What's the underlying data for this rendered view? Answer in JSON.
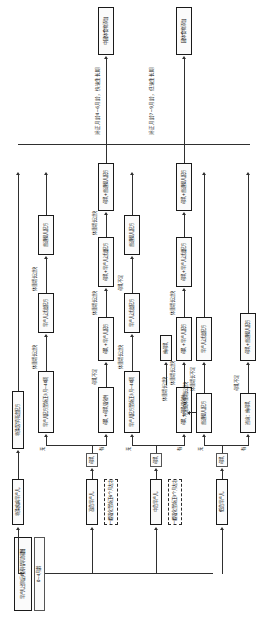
{
  "diagram": {
    "title": "早产儿出院后喂养指导流程图",
    "type": "flowchart",
    "orientation": "rotated-90-ccw",
    "entry": {
      "label": "早产儿出院后喂养指导流程图",
      "sublabel": "0~4月龄"
    },
    "risk_levels": [
      {
        "key": "high",
        "label": "特殊疾病早产儿"
      },
      {
        "key": "middle",
        "label": "中危早产儿"
      },
      {
        "key": "low",
        "label": "低危早产儿"
      }
    ],
    "notes": [
      {
        "id": "n1",
        "label": "一般强化至矫正6个月左右"
      },
      {
        "id": "n2",
        "label": "一般强化至矫正3个月左右"
      }
    ],
    "milk_gate": {
      "label": "母乳"
    },
    "answers": {
      "yes": "有",
      "no": "无"
    },
    "stages": [
      {
        "label": "矫正月龄4~6月龄，快速生长期"
      },
      {
        "label": "矫正月龄7~9月龄，低速生长期"
      }
    ],
    "outputs": [
      {
        "label": "中固体食物添加"
      },
      {
        "label": "固体食物添加"
      }
    ],
    "branches": [
      {
        "id": "special",
        "header": "特殊疾病早产儿",
        "nodes": [
          {
            "label": "特殊医学用途配方"
          }
        ],
        "edge_labels": []
      },
      {
        "id": "high-risk",
        "header": "高危早产儿",
        "nodes": [
          {
            "label": "母乳"
          },
          {
            "label": "早产儿配方至矫正3月~40周"
          },
          {
            "label": "早产儿过渡配方"
          },
          {
            "label": "普通婴儿配方"
          },
          {
            "label": "母乳+母乳强化剂"
          },
          {
            "label": "母乳+早产儿配方"
          },
          {
            "label": "母乳+早产儿过渡配方"
          },
          {
            "label": "母乳+普通婴儿配方"
          }
        ],
        "edge_labels": [
          "体重增长过快",
          "体重增长过快",
          "母乳不足",
          "体重增长过快",
          "体重增长过快",
          "体重增长过快"
        ]
      },
      {
        "id": "middle-risk",
        "header": "中危早产儿",
        "nodes": [
          {
            "label": "母乳"
          },
          {
            "label": "早产儿配方至矫正3月~40周"
          },
          {
            "label": "早产儿过渡配方"
          },
          {
            "label": "普通婴儿配方"
          },
          {
            "label": "母乳+母乳强化剂"
          },
          {
            "label": "母乳+早产儿配方"
          },
          {
            "label": "母乳+早产儿过渡配方"
          },
          {
            "label": "母乳+普通婴儿配方"
          },
          {
            "label": "纯母乳"
          }
        ],
        "edge_labels": [
          "体重增长过快",
          "母乳不足",
          "体重增长过快",
          "体重增长过快",
          "体重增长过快"
        ]
      },
      {
        "id": "low-risk",
        "header": "低危早产儿",
        "nodes": [
          {
            "label": "母乳"
          },
          {
            "label": "普通婴儿配方"
          },
          {
            "label": "早产儿过渡配方"
          },
          {
            "label": "咨询：纯母乳"
          },
          {
            "label": "母乳+普通婴儿配方"
          }
        ],
        "edge_labels": [
          "不足或体重增长过快",
          "体重增长不足",
          "母乳不足"
        ]
      }
    ]
  }
}
